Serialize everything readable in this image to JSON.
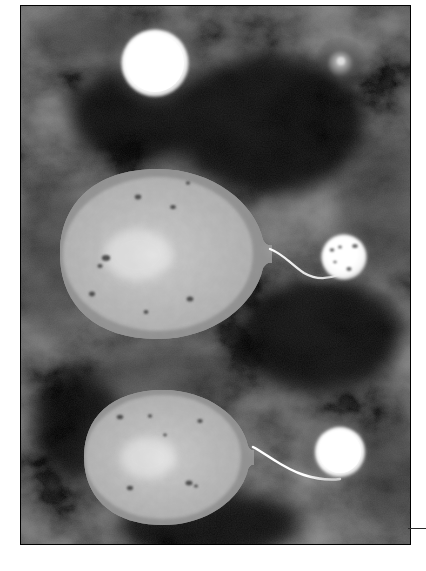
{
  "figure": {
    "medium": "grayscale astronomical illustration",
    "alt_text": "Two binary star systems rendered in grayscale against a mottled dark nebular background. Each system shows a large teardrop-shaped distorted giant star whose pointed tip feeds a thin bright accretion stream into a small bright compact companion star. Two isolated round stars appear in the upper portion of the plate.",
    "plate": {
      "x": 20,
      "y": 5,
      "width": 391,
      "height": 540,
      "background_color": "#050505",
      "nebula_tone": "#3a3a3a",
      "border_color": "#000000"
    },
    "edge_rule": {
      "name": "bottom-right-rule",
      "x": 408,
      "y": 528,
      "width": 18,
      "height": 1,
      "color": "#2a2a2a"
    },
    "page_background": "#ffffff"
  },
  "palette": {
    "star_core": "#ffffff",
    "star_mid": "#e8e8e8",
    "star_edge": "#9a9a9a",
    "giant_surface": "#b9b9b9",
    "giant_limb": "#8c8c8c",
    "starspot": "#5a5a5a",
    "stream": "#f2f2f2",
    "halo": "#c8c8c8",
    "space": "#050505",
    "cloud_light": "#474747",
    "cloud_dark": "#101010"
  },
  "objects": [
    {
      "id": "star-isolated-bright",
      "name": "isolated-bright-star",
      "label": "Bright isolated star (upper left)",
      "kind": "round-star",
      "cx": 155,
      "cy": 63,
      "r": 33,
      "halo_r": 52,
      "brightness": "very-high",
      "core_color": "#ffffff",
      "spots": []
    },
    {
      "id": "star-isolated-dim",
      "name": "isolated-dim-star",
      "label": "Faint isolated star (upper right)",
      "kind": "round-star",
      "cx": 341,
      "cy": 63,
      "r": 13,
      "halo_r": 26,
      "brightness": "low",
      "core_color": "#b4b4b4",
      "spots": []
    },
    {
      "id": "giant-upper",
      "name": "giant-star-upper",
      "label": "Distorted giant star, upper binary",
      "kind": "teardrop-giant",
      "cx": 158,
      "cy": 262,
      "rx": 98,
      "ry": 78,
      "tip_x": 272,
      "tip_y": 258,
      "surface": "granulated",
      "spots": [
        {
          "x": 138,
          "y": 204,
          "r": 3.0
        },
        {
          "x": 173,
          "y": 214,
          "r": 2.6
        },
        {
          "x": 106,
          "y": 265,
          "r": 4.0
        },
        {
          "x": 100,
          "y": 272,
          "r": 2.4
        },
        {
          "x": 92,
          "y": 300,
          "r": 3.0
        },
        {
          "x": 190,
          "y": 305,
          "r": 3.2
        },
        {
          "x": 146,
          "y": 318,
          "r": 2.2
        }
      ]
    },
    {
      "id": "companion-upper",
      "name": "companion-star-upper",
      "label": "Compact companion, upper binary",
      "kind": "round-star",
      "cx": 344,
      "cy": 257,
      "r": 22,
      "halo_r": 34,
      "brightness": "high",
      "core_color": "#fbfbfb",
      "spots": [
        {
          "x": 332,
          "y": 250,
          "r": 2.2
        },
        {
          "x": 340,
          "y": 247,
          "r": 1.8
        },
        {
          "x": 355,
          "y": 246,
          "r": 2.6
        },
        {
          "x": 349,
          "y": 269,
          "r": 2.4
        },
        {
          "x": 335,
          "y": 262,
          "r": 1.6
        }
      ]
    },
    {
      "id": "stream-upper",
      "name": "accretion-stream-upper",
      "label": "Accretion stream, upper binary",
      "kind": "stream",
      "from": [
        272,
        258
      ],
      "to": [
        332,
        274
      ],
      "control": [
        300,
        288
      ],
      "width": 2.4,
      "color": "#f2f2f2"
    },
    {
      "id": "giant-lower",
      "name": "giant-star-lower",
      "label": "Distorted giant star, lower binary",
      "kind": "teardrop-giant",
      "cx": 163,
      "cy": 452,
      "rx": 80,
      "ry": 63,
      "tip_x": 254,
      "tip_y": 450,
      "surface": "granulated",
      "spots": [
        {
          "x": 120,
          "y": 417,
          "r": 3.0
        },
        {
          "x": 150,
          "y": 416,
          "r": 2.0
        },
        {
          "x": 200,
          "y": 421,
          "r": 2.6
        },
        {
          "x": 130,
          "y": 488,
          "r": 3.0
        },
        {
          "x": 189,
          "y": 483,
          "r": 3.4
        },
        {
          "x": 196,
          "y": 486,
          "r": 2.0
        }
      ]
    },
    {
      "id": "companion-lower",
      "name": "companion-star-lower",
      "label": "Compact companion, lower binary",
      "kind": "round-star",
      "cx": 340,
      "cy": 452,
      "r": 25,
      "halo_r": 40,
      "brightness": "very-high",
      "core_color": "#ffffff",
      "spots": []
    },
    {
      "id": "stream-lower",
      "name": "accretion-stream-lower",
      "label": "Accretion stream, lower binary",
      "kind": "stream",
      "from": [
        254,
        450
      ],
      "to": [
        330,
        478
      ],
      "control": [
        288,
        478
      ],
      "width": 2.6,
      "color": "#ffffff"
    }
  ]
}
